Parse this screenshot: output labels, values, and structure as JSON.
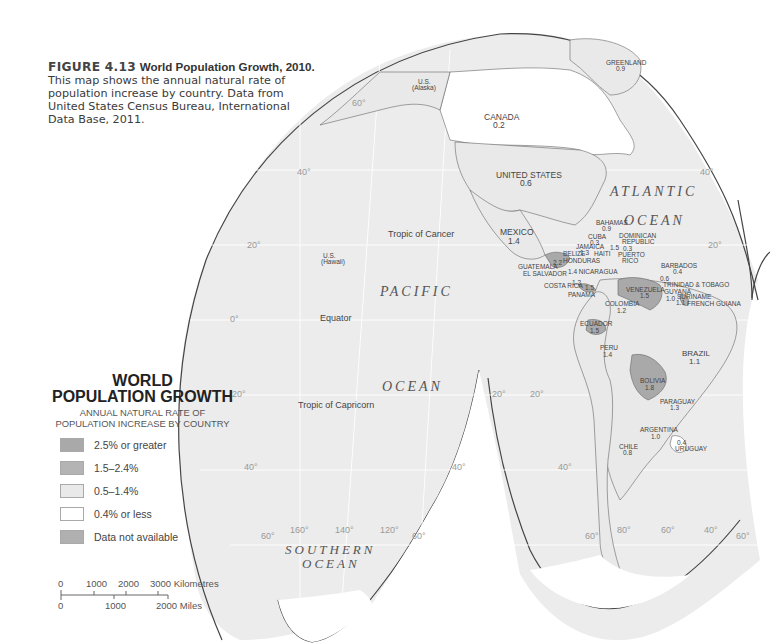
{
  "caption": {
    "figure_label": "FIGURE 4.13",
    "title": "World Population Growth, 2010.",
    "body": "This map shows the annual natural rate of population increase by country. Data from United States Census Bureau, International Data Base, 2011."
  },
  "legend": {
    "title_line1": "WORLD",
    "title_line2": "POPULATION GROWTH",
    "subtitle_line1": "ANNUAL NATURAL RATE OF",
    "subtitle_line2": "POPULATION INCREASE BY COUNTRY",
    "items": [
      {
        "label": "2.5% or greater",
        "color": "#a9a9a9"
      },
      {
        "label": "1.5–2.4%",
        "color": "#b4b4b4"
      },
      {
        "label": "0.5–1.4%",
        "color": "#e9e9e9"
      },
      {
        "label": "0.4% or less",
        "color": "#ffffff"
      },
      {
        "label": "Data not available",
        "color": "#b0b0b0"
      }
    ]
  },
  "scale_bar": {
    "km_ticks": [
      "0",
      "1000",
      "2000",
      "3000 Kilometres"
    ],
    "mi_ticks": [
      "0",
      "1000",
      "2000 Miles"
    ]
  },
  "oceans": {
    "atlantic_1": "ATLANTIC",
    "atlantic_2": "OCEAN",
    "pacific_1": "PACIFIC",
    "pacific_2": "OCEAN",
    "southern_1": "SOUTHERN",
    "southern_2": "OCEAN"
  },
  "reference_lines": {
    "tropic_cancer": "Tropic of Cancer",
    "equator": "Equator",
    "tropic_capricorn": "Tropic of Capricorn"
  },
  "graticule_labels": {
    "lat_60n": "60°",
    "lat_40n": "40°",
    "lat_20n": "20°",
    "lat_0": "0°",
    "lat_20s": "20°",
    "lat_40s": "40°",
    "lat_60s": "60°",
    "lon_160": "160°",
    "lon_140": "140°",
    "lon_120": "120°",
    "lon_80": "80°",
    "lon_60": "60°",
    "lon_40": "40°"
  },
  "countries": [
    {
      "name": "GREENLAND",
      "value": "0.9",
      "category": "0.5-1.4%"
    },
    {
      "name": "U.S. (Alaska)",
      "value": "",
      "category": "0.5-1.4%"
    },
    {
      "name": "CANADA",
      "value": "0.2",
      "category": "0.4% or less"
    },
    {
      "name": "UNITED STATES",
      "value": "0.6",
      "category": "0.5-1.4%"
    },
    {
      "name": "U.S. (Hawaii)",
      "value": "",
      "category": "0.5-1.4%"
    },
    {
      "name": "MEXICO",
      "value": "1.4",
      "category": "0.5-1.4%"
    },
    {
      "name": "BAHAMAS",
      "value": "0.9",
      "category": "0.5-1.4%"
    },
    {
      "name": "CUBA",
      "value": "0.3",
      "category": "0.4% or less"
    },
    {
      "name": "JAMAICA",
      "value": "1.3",
      "category": "0.5-1.4%"
    },
    {
      "name": "HAITI",
      "value": "",
      "category": "1.5-2.4%"
    },
    {
      "name": "DOMINICAN REPUBLIC",
      "value": "1.5",
      "category": "1.5-2.4%"
    },
    {
      "name": "PUERTO RICO",
      "value": "0.3",
      "category": "0.4% or less"
    },
    {
      "name": "BELIZE",
      "value": "",
      "category": "1.5-2.4%"
    },
    {
      "name": "HONDURAS",
      "value": "",
      "category": "1.5-2.4%"
    },
    {
      "name": "GUATEMALA",
      "value": "2.2",
      "category": "1.5-2.4%"
    },
    {
      "name": "EL SALVADOR",
      "value": "",
      "category": "0.5-1.4%"
    },
    {
      "name": "NICARAGUA",
      "value": "1.4",
      "category": "0.5-1.4%"
    },
    {
      "name": "COSTA RICA",
      "value": "1.2",
      "category": "0.5-1.4%"
    },
    {
      "name": "PANAMA",
      "value": "1.5",
      "category": "1.5-2.4%"
    },
    {
      "name": "BARBADOS",
      "value": "0.4",
      "category": "0.4% or less"
    },
    {
      "name": "TRINIDAD & TOBAGO",
      "value": "0.6",
      "category": "0.5-1.4%"
    },
    {
      "name": "VENEZUELA",
      "value": "1.5",
      "category": "1.5-2.4%"
    },
    {
      "name": "GUYANA",
      "value": "1.0",
      "category": "0.5-1.4%"
    },
    {
      "name": "SURINAME",
      "value": "1.1",
      "category": "0.5-1.4%"
    },
    {
      "name": "FRENCH GUIANA",
      "value": "",
      "category": "Data not available"
    },
    {
      "name": "COLOMBIA",
      "value": "1.2",
      "category": "0.5-1.4%"
    },
    {
      "name": "ECUADOR",
      "value": "1.5",
      "category": "1.5-2.4%"
    },
    {
      "name": "PERU",
      "value": "1.4",
      "category": "0.5-1.4%"
    },
    {
      "name": "BRAZIL",
      "value": "1.1",
      "category": "0.5-1.4%"
    },
    {
      "name": "BOLIVIA",
      "value": "1.8",
      "category": "1.5-2.4%"
    },
    {
      "name": "PARAGUAY",
      "value": "1.3",
      "category": "0.5-1.4%"
    },
    {
      "name": "ARGENTINA",
      "value": "1.0",
      "category": "0.5-1.4%"
    },
    {
      "name": "CHILE",
      "value": "0.8",
      "category": "0.5-1.4%"
    },
    {
      "name": "URUGUAY",
      "value": "0.4",
      "category": "0.4% or less"
    }
  ],
  "map_labels": {
    "greenland": "GREENLAND",
    "greenland_v": "0.9",
    "alaska_1": "U.S.",
    "alaska_2": "(Alaska)",
    "canada": "CANADA",
    "canada_v": "0.2",
    "usa": "UNITED STATES",
    "usa_v": "0.6",
    "hawaii_1": "U.S.",
    "hawaii_2": "(Hawaii)",
    "mexico": "MEXICO",
    "mexico_v": "1.4",
    "bahamas": "BAHAMAS",
    "bahamas_v": "0.9",
    "cuba": "CUBA",
    "cuba_v": "0.3",
    "jamaica": "JAMAICA",
    "jamaica_v": "1.3",
    "haiti": "HAITI",
    "dominican_1": "DOMINICAN",
    "dominican_2": "REPUBLIC",
    "dominican_v": "1.5",
    "pr_v": "0.3",
    "pr_1": "PUERTO",
    "pr_2": "RICO",
    "belize": "BELIZE",
    "honduras": "HONDURAS",
    "guatemala": "GUATEMALA",
    "guatemala_v": "2.2",
    "el_salvador": "EL SALVADOR",
    "nicaragua": "1.4 NICARAGUA",
    "costa_rica": "COSTA RICA",
    "costa_rica_v": "1.2",
    "panama": "PANAMA",
    "panama_v": "1.5",
    "barbados": "BARBADOS",
    "barbados_v": "0.4",
    "trinidad_v": "0.6",
    "trinidad": "TRINIDAD & TOBAGO",
    "venezuela": "VENEZUELA",
    "venezuela_v": "1.5",
    "guyana": "GUYANA",
    "guyana_v": "1.0",
    "suriname": "SURINAME",
    "suriname_v": "1.1",
    "french_guiana": "FRENCH GUIANA",
    "colombia": "COLOMBIA",
    "colombia_v": "1.2",
    "ecuador": "ECUADOR",
    "ecuador_v": "1.5",
    "peru": "PERU",
    "peru_v": "1.4",
    "brazil": "BRAZIL",
    "brazil_v": "1.1",
    "bolivia": "BOLIVIA",
    "bolivia_v": "1.8",
    "paraguay": "PARAGUAY",
    "paraguay_v": "1.3",
    "argentina": "ARGENTINA",
    "argentina_v": "1.0",
    "chile": "CHILE",
    "chile_v": "0.8",
    "uruguay_v": "0.4",
    "uruguay": "URUGUAY"
  },
  "colors": {
    "ocean_fill": "#ececec",
    "land_low": "#ffffff",
    "land_mid": "#e9e9e9",
    "land_high": "#a9a9a9",
    "outline": "#444444"
  }
}
